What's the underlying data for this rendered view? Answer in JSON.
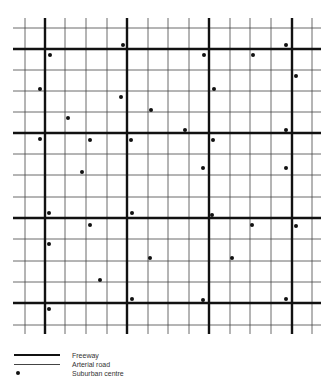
{
  "diagram": {
    "grid_extent": {
      "x_min": 13,
      "x_max": 321,
      "y_min": 18,
      "y_max": 334
    },
    "arterial_x": [
      25,
      65,
      86,
      107,
      148,
      168,
      189,
      230,
      250,
      271,
      312
    ],
    "freeway_x": [
      45,
      127,
      209,
      292
    ],
    "arterial_y": [
      28,
      70,
      91,
      112,
      154,
      175,
      197,
      239,
      261,
      282,
      325
    ],
    "freeway_y": [
      49,
      133,
      218,
      303
    ],
    "suburban_centres": [
      [
        123,
        45
      ],
      [
        50,
        55
      ],
      [
        204,
        55
      ],
      [
        253,
        55
      ],
      [
        286,
        45
      ],
      [
        296,
        76
      ],
      [
        40,
        89
      ],
      [
        121,
        97
      ],
      [
        214,
        89
      ],
      [
        151,
        110
      ],
      [
        68,
        118
      ],
      [
        185,
        130
      ],
      [
        286,
        130
      ],
      [
        40,
        139
      ],
      [
        90,
        140
      ],
      [
        131,
        140
      ],
      [
        213,
        140
      ],
      [
        82,
        172
      ],
      [
        203,
        168
      ],
      [
        286,
        168
      ],
      [
        49,
        213
      ],
      [
        132,
        213
      ],
      [
        212,
        215
      ],
      [
        90,
        225
      ],
      [
        252,
        225
      ],
      [
        296,
        226
      ],
      [
        49,
        244
      ],
      [
        150,
        258
      ],
      [
        232,
        258
      ],
      [
        100,
        280
      ],
      [
        132,
        299
      ],
      [
        203,
        300
      ],
      [
        286,
        299
      ],
      [
        49,
        309
      ]
    ],
    "colors": {
      "road": "#111111",
      "arterial": "#444444",
      "background": "#ffffff"
    }
  },
  "legend": {
    "items": [
      {
        "label": "Freeway",
        "symbol": "thick-line"
      },
      {
        "label": "Arterial road",
        "symbol": "thin-line"
      },
      {
        "label": "Suburban centre",
        "symbol": "dot"
      }
    ]
  }
}
